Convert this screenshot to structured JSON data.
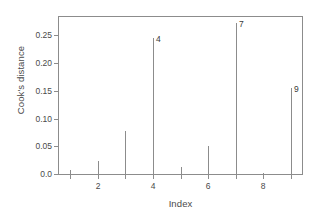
{
  "chart_data": {
    "type": "bar",
    "title": "",
    "subtitle": "",
    "xlabel": "Index",
    "ylabel": "Cook's distance",
    "categories": [
      1,
      2,
      3,
      4,
      5,
      6,
      7,
      8,
      9
    ],
    "values": [
      0.007,
      0.024,
      0.078,
      0.245,
      0.013,
      0.05,
      0.272,
      0.002,
      0.155
    ],
    "point_labels": [
      {
        "index": 4,
        "label": "4",
        "value": 0.245
      },
      {
        "index": 7,
        "label": "7",
        "value": 0.272
      },
      {
        "index": 9,
        "label": "9",
        "value": 0.155
      }
    ],
    "xlim": [
      0.55,
      9.45
    ],
    "ylim": [
      0.0,
      0.285
    ],
    "xticks": [
      2,
      4,
      6,
      8
    ],
    "xtick_labels": [
      "2",
      "4",
      "6",
      "8"
    ],
    "yticks": [
      0.0,
      0.05,
      0.1,
      0.15,
      0.2,
      0.25
    ],
    "ytick_labels": [
      "0.0",
      "0.05",
      "0.10",
      "0.15",
      "0.20",
      "0.25"
    ],
    "grid": false,
    "legend": null,
    "series_color": "#8c8c8c",
    "frame_color": "#8c8c8c",
    "text_color": "#4a4a4a"
  }
}
